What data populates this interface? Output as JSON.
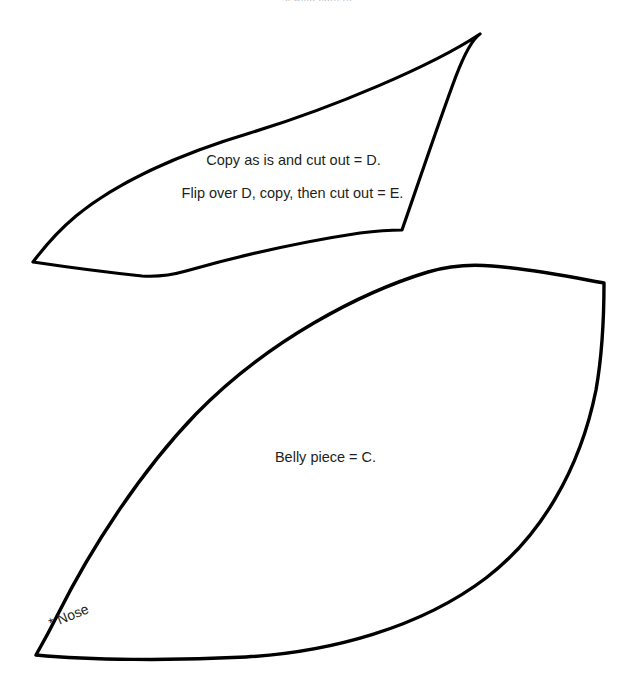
{
  "page": {
    "background_color": "#ffffff",
    "ink_color": "#000000",
    "text_color": "#231f20",
    "width": 635,
    "height": 685,
    "document_type": "sewing-pattern-template-sheet"
  },
  "header": {
    "clipped_text": "sewing pattern",
    "color": "#b9b6bb",
    "note": "text clipped at top edge of page, illegible"
  },
  "labels": {
    "copy_as_is": "Copy as is and cut out = D.",
    "flip_over": "Flip over D, copy, then cut out = E.",
    "belly_piece": "Belly piece = C.",
    "nose_marker": "* Nose"
  },
  "shapes": [
    {
      "name": "upper-wing-piece",
      "piece_ids": [
        "D",
        "E"
      ],
      "stroke_color": "#000000",
      "stroke_width": 3.2,
      "fill": "none",
      "vertices": [
        [
          480,
          34
        ],
        [
          402,
          230
        ],
        [
          165,
          276
        ],
        [
          33,
          262
        ]
      ]
    },
    {
      "name": "belly-piece",
      "piece_ids": [
        "C"
      ],
      "stroke_color": "#000000",
      "stroke_width": 3.4,
      "fill": "none",
      "vertices": [
        [
          604,
          283
        ],
        [
          460,
          266
        ],
        [
          36,
          655
        ]
      ]
    }
  ]
}
